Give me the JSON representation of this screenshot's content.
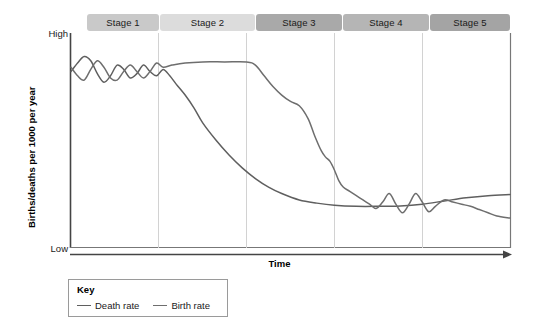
{
  "figure": {
    "type": "demographic-transition-model",
    "background": "#ffffff"
  },
  "axes": {
    "y_axis_label": "Births/deaths per 1000 per year",
    "y_tick_high": "High",
    "y_tick_low": "Low",
    "x_axis_label": "Time",
    "axis_color": "#444444"
  },
  "stages": [
    {
      "label": "Stage 1",
      "color": "#c9c9c9"
    },
    {
      "label": "Stage 2",
      "color": "#dcdcdc"
    },
    {
      "label": "Stage 3",
      "color": "#a9a9a9"
    },
    {
      "label": "Stage 4",
      "color": "#b5b5b5"
    },
    {
      "label": "Stage 5",
      "color": "#a4a4a4"
    }
  ],
  "legend": {
    "title": "Key",
    "items": [
      {
        "label": "Death rate",
        "color": "#5f5f5f"
      },
      {
        "label": "Birth rate",
        "color": "#6e6e6e"
      }
    ]
  },
  "chart_data": {
    "type": "line",
    "title": "",
    "xlabel": "Time",
    "ylabel": "Births/deaths per 1000 per year",
    "xlim": [
      0,
      100
    ],
    "ylim": [
      0,
      100
    ],
    "ytick_labels": [
      "Low",
      "High"
    ],
    "grid": false,
    "legend_position": "bottom-left",
    "stage_boundaries": [
      0,
      20,
      40,
      60,
      80,
      100
    ],
    "series": [
      {
        "name": "Death rate",
        "color": "#5f5f5f",
        "points": [
          [
            0.0,
            82.0
          ],
          [
            1.5,
            86.0
          ],
          [
            3.0,
            89.0
          ],
          [
            4.5,
            87.0
          ],
          [
            6.0,
            81.0
          ],
          [
            7.5,
            77.0
          ],
          [
            9.0,
            80.0
          ],
          [
            10.5,
            85.0
          ],
          [
            12.0,
            83.0
          ],
          [
            13.5,
            79.0
          ],
          [
            15.0,
            81.0
          ],
          [
            16.5,
            85.0
          ],
          [
            18.0,
            82.0
          ],
          [
            19.5,
            80.0
          ],
          [
            21.0,
            83.0
          ],
          [
            22.5,
            80.0
          ],
          [
            24.0,
            76.0
          ],
          [
            26.0,
            71.0
          ],
          [
            28.0,
            65.0
          ],
          [
            30.0,
            58.0
          ],
          [
            33.0,
            50.0
          ],
          [
            36.0,
            43.0
          ],
          [
            39.0,
            37.0
          ],
          [
            42.0,
            32.0
          ],
          [
            45.0,
            28.0
          ],
          [
            48.0,
            25.0
          ],
          [
            52.0,
            22.0
          ],
          [
            56.0,
            20.5
          ],
          [
            60.0,
            19.5
          ],
          [
            65.0,
            19.0
          ],
          [
            70.0,
            19.0
          ],
          [
            75.0,
            19.2
          ],
          [
            80.0,
            20.0
          ],
          [
            85.0,
            21.5
          ],
          [
            90.0,
            23.0
          ],
          [
            95.0,
            24.0
          ],
          [
            100.0,
            24.5
          ]
        ]
      },
      {
        "name": "Birth rate",
        "color": "#6e6e6e",
        "points": [
          [
            0.0,
            84.0
          ],
          [
            1.5,
            80.0
          ],
          [
            3.0,
            78.0
          ],
          [
            4.5,
            83.0
          ],
          [
            6.0,
            87.0
          ],
          [
            7.5,
            84.0
          ],
          [
            9.0,
            79.0
          ],
          [
            10.5,
            78.0
          ],
          [
            12.0,
            82.0
          ],
          [
            13.5,
            85.0
          ],
          [
            15.0,
            82.0
          ],
          [
            16.5,
            79.0
          ],
          [
            18.0,
            82.0
          ],
          [
            19.5,
            86.0
          ],
          [
            21.0,
            84.0
          ],
          [
            23.0,
            85.0
          ],
          [
            26.0,
            86.0
          ],
          [
            30.0,
            86.5
          ],
          [
            35.0,
            86.5
          ],
          [
            40.0,
            86.5
          ],
          [
            42.0,
            85.0
          ],
          [
            44.0,
            80.0
          ],
          [
            46.0,
            75.0
          ],
          [
            48.0,
            71.0
          ],
          [
            50.0,
            68.0
          ],
          [
            52.0,
            66.0
          ],
          [
            54.0,
            60.0
          ],
          [
            55.5,
            52.0
          ],
          [
            57.0,
            45.0
          ],
          [
            58.0,
            42.0
          ],
          [
            59.0,
            40.0
          ],
          [
            60.0,
            36.0
          ],
          [
            61.0,
            31.0
          ],
          [
            62.0,
            28.0
          ],
          [
            63.5,
            26.0
          ],
          [
            65.0,
            24.0
          ],
          [
            66.5,
            22.0
          ],
          [
            68.0,
            20.0
          ],
          [
            69.5,
            18.0
          ],
          [
            71.0,
            21.0
          ],
          [
            72.5,
            25.0
          ],
          [
            74.0,
            20.0
          ],
          [
            75.5,
            16.0
          ],
          [
            77.0,
            20.0
          ],
          [
            78.5,
            25.0
          ],
          [
            80.0,
            21.0
          ],
          [
            81.5,
            16.5
          ],
          [
            83.0,
            19.0
          ],
          [
            85.0,
            22.0
          ],
          [
            87.0,
            21.0
          ],
          [
            89.0,
            20.0
          ],
          [
            91.0,
            19.0
          ],
          [
            93.0,
            17.5
          ],
          [
            95.0,
            16.0
          ],
          [
            97.0,
            14.5
          ],
          [
            100.0,
            13.5
          ]
        ]
      }
    ]
  }
}
